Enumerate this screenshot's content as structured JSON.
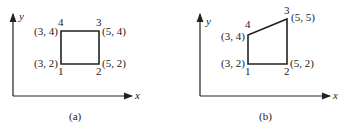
{
  "figures": [
    {
      "caption": "(a)",
      "axis_x": "x",
      "axis_y": "y",
      "vertices": [
        {
          "num": "1",
          "coord": "(3, 2)"
        },
        {
          "num": "2",
          "coord": "(5, 2)"
        },
        {
          "num": "3",
          "coord": "(5, 4)"
        },
        {
          "num": "4",
          "coord": "(3, 4)"
        }
      ]
    },
    {
      "caption": "(b)",
      "axis_x": "x",
      "axis_y": "y",
      "vertices": [
        {
          "num": "1",
          "coord": "(3, 2)"
        },
        {
          "num": "2",
          "coord": "(5, 2)"
        },
        {
          "num": "3",
          "coord": "(5, 5)"
        },
        {
          "num": "4",
          "coord": "(3, 4)"
        }
      ]
    }
  ]
}
